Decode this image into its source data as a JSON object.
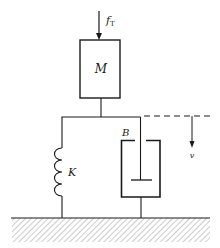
{
  "diagram": {
    "colors": {
      "line": "#1a1a1a",
      "hatch": "#9a9a9a",
      "background": "#ffffff"
    },
    "labels": {
      "force": "f",
      "force_subscript": "T",
      "mass": "M",
      "spring": "K",
      "damper": "B",
      "velocity": "v"
    },
    "components": [
      {
        "id": "force-arrow",
        "type": "arrow",
        "direction": "down",
        "label": "f_T"
      },
      {
        "id": "mass",
        "type": "block",
        "label": "M"
      },
      {
        "id": "spring",
        "type": "spring",
        "label": "K",
        "coils": 4
      },
      {
        "id": "damper",
        "type": "dashpot",
        "label": "B"
      },
      {
        "id": "velocity-reference",
        "type": "dashed-line-arrow",
        "direction": "down",
        "label": "v"
      },
      {
        "id": "ground",
        "type": "fixed-ground-hatched"
      }
    ]
  }
}
